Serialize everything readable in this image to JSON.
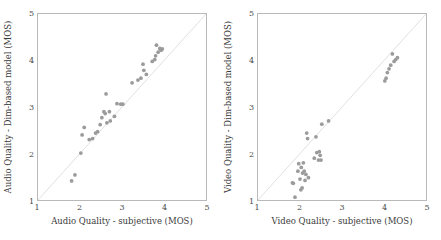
{
  "figure": {
    "background": "#ffffff",
    "point_color": "#9b9b9b",
    "frame_color": "#b9b9b9",
    "diagonal_color": "#d2d2d2"
  },
  "chart_data": [
    {
      "type": "scatter",
      "panel": "left",
      "title": "",
      "xlabel": "Audio Quality - subjective (MOS)",
      "ylabel": "Audio Quality - Dim-based model (MOS)",
      "xlim": [
        1,
        5
      ],
      "ylim": [
        1,
        5
      ],
      "xticks": [
        1,
        2,
        3,
        4,
        5
      ],
      "yticks": [
        1,
        2,
        3,
        4,
        5
      ],
      "xticklabels": [
        "1",
        "2",
        "3",
        "4",
        "5"
      ],
      "yticklabels": [
        "1",
        "2",
        "3",
        "4",
        "5"
      ],
      "grid": false,
      "legend": null,
      "reference_line": {
        "type": "identity",
        "from": [
          1,
          1
        ],
        "to": [
          5,
          5
        ]
      },
      "points": [
        [
          1.8,
          1.41
        ],
        [
          1.88,
          1.54
        ],
        [
          2.02,
          2.01
        ],
        [
          2.05,
          2.4
        ],
        [
          2.1,
          2.56
        ],
        [
          2.22,
          2.3
        ],
        [
          2.3,
          2.32
        ],
        [
          2.37,
          2.44
        ],
        [
          2.42,
          2.47
        ],
        [
          2.48,
          2.62
        ],
        [
          2.52,
          2.77
        ],
        [
          2.57,
          2.9
        ],
        [
          2.6,
          2.86
        ],
        [
          2.62,
          3.28
        ],
        [
          2.64,
          2.66
        ],
        [
          2.7,
          2.9
        ],
        [
          2.72,
          2.7
        ],
        [
          2.82,
          2.8
        ],
        [
          2.88,
          3.07
        ],
        [
          2.97,
          3.06
        ],
        [
          3.02,
          3.06
        ],
        [
          3.24,
          3.52
        ],
        [
          3.38,
          3.58
        ],
        [
          3.45,
          3.62
        ],
        [
          3.5,
          3.92
        ],
        [
          3.52,
          3.79
        ],
        [
          3.58,
          3.7
        ],
        [
          3.72,
          3.98
        ],
        [
          3.78,
          4.02
        ],
        [
          3.8,
          4.1
        ],
        [
          3.82,
          4.33
        ],
        [
          3.86,
          4.18
        ],
        [
          3.9,
          4.26
        ],
        [
          3.93,
          4.22
        ],
        [
          3.96,
          4.25
        ]
      ]
    },
    {
      "type": "scatter",
      "panel": "right",
      "title": "",
      "xlabel": "Video Quality - subjective (MOS)",
      "ylabel": "Video Quality - Dim-based model (MOS)",
      "xlim": [
        1,
        5
      ],
      "ylim": [
        1,
        5
      ],
      "xticks": [
        1,
        2,
        3,
        4,
        5
      ],
      "yticks": [
        1,
        2,
        3,
        4,
        5
      ],
      "xticklabels": [
        "1",
        "2",
        "3",
        "4",
        "5"
      ],
      "yticklabels": [
        "1",
        "2",
        "3",
        "4",
        "5"
      ],
      "grid": false,
      "legend": null,
      "reference_line": {
        "type": "identity",
        "from": [
          1,
          1
        ],
        "to": [
          5,
          5
        ]
      },
      "points": [
        [
          1.82,
          1.37
        ],
        [
          1.84,
          1.36
        ],
        [
          1.88,
          1.06
        ],
        [
          1.95,
          1.62
        ],
        [
          1.97,
          1.78
        ],
        [
          2.0,
          1.45
        ],
        [
          2.02,
          1.22
        ],
        [
          2.03,
          1.7
        ],
        [
          2.05,
          1.26
        ],
        [
          2.06,
          1.58
        ],
        [
          2.08,
          1.8
        ],
        [
          2.1,
          1.62
        ],
        [
          2.12,
          1.42
        ],
        [
          2.14,
          1.55
        ],
        [
          2.16,
          2.44
        ],
        [
          2.18,
          2.32
        ],
        [
          2.2,
          1.48
        ],
        [
          2.34,
          1.9
        ],
        [
          2.38,
          2.36
        ],
        [
          2.4,
          2.02
        ],
        [
          2.44,
          1.86
        ],
        [
          2.46,
          2.04
        ],
        [
          2.48,
          1.96
        ],
        [
          2.5,
          1.86
        ],
        [
          2.52,
          2.63
        ],
        [
          2.68,
          2.7
        ],
        [
          4.02,
          3.56
        ],
        [
          4.05,
          3.62
        ],
        [
          4.08,
          3.74
        ],
        [
          4.12,
          3.82
        ],
        [
          4.16,
          3.9
        ],
        [
          4.2,
          4.14
        ],
        [
          4.24,
          3.98
        ],
        [
          4.28,
          4.02
        ],
        [
          4.32,
          4.06
        ]
      ]
    }
  ],
  "panels": {
    "left": {
      "name": "audio-quality-scatter",
      "xlabel": "Audio Quality - subjective (MOS)",
      "ylabel": "Audio Quality - Dim-based model (MOS)",
      "xticklabels": [
        "1",
        "2",
        "3",
        "4",
        "5"
      ],
      "yticklabels": [
        "1",
        "2",
        "3",
        "4",
        "5"
      ]
    },
    "right": {
      "name": "video-quality-scatter",
      "xlabel": "Video Quality - subjective (MOS)",
      "ylabel": "Video Quality - Dim-based model (MOS)",
      "xticklabels": [
        "1",
        "2",
        "3",
        "4",
        "5"
      ],
      "yticklabels": [
        "1",
        "2",
        "3",
        "4",
        "5"
      ]
    }
  }
}
